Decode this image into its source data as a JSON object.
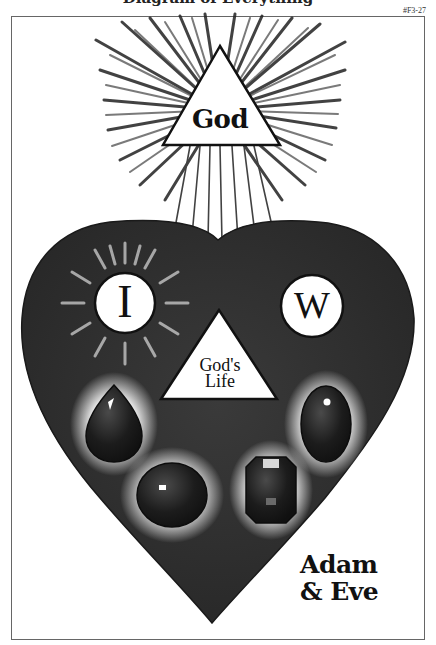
{
  "header": {
    "cut_title": "Diagram of Everything",
    "reference_code": "#F3-27"
  },
  "diagram": {
    "top_triangle": {
      "label": "God",
      "icon": "radiant-triangle"
    },
    "heart": {
      "icon": "heart",
      "fill": "#2e2e2e",
      "left_circle": {
        "label": "I",
        "icon": "sunburst-circle"
      },
      "right_circle": {
        "label": "W",
        "icon": "circle"
      },
      "center_triangle": {
        "label_line1": "God's",
        "label_line2": "Life"
      },
      "gems": [
        {
          "shape": "teardrop"
        },
        {
          "shape": "oval"
        },
        {
          "shape": "round"
        },
        {
          "shape": "octagon"
        }
      ]
    },
    "caption_line1": "Adam",
    "caption_line2": "& Eve"
  },
  "colors": {
    "ink": "#111111",
    "heart": "#2e2e2e",
    "paper": "#ffffff",
    "frame": "#666666"
  }
}
